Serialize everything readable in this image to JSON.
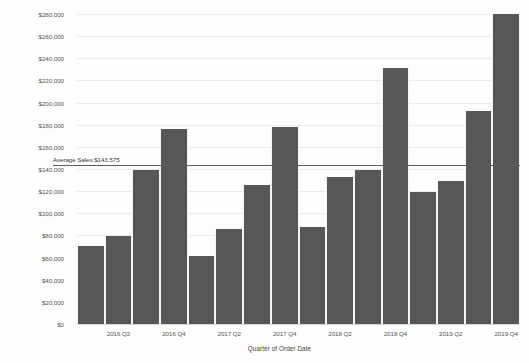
{
  "chart_data": {
    "type": "bar",
    "title": "",
    "xlabel": "Quarter of Order Date",
    "ylabel": "Sales",
    "ylim": [
      0,
      280000
    ],
    "ytick_step": 20000,
    "grid": true,
    "legend": "none",
    "bar_color": "#555759",
    "categories": [
      "2016 Q1",
      "2016 Q2",
      "2016 Q3",
      "2016 Q4",
      "2017 Q1",
      "2017 Q2",
      "2017 Q3",
      "2017 Q4",
      "2018 Q1",
      "2018 Q2",
      "2018 Q3",
      "2018 Q4",
      "2019 Q1",
      "2019 Q2",
      "2019 Q3",
      "2019 Q4"
    ],
    "values": [
      70500,
      79500,
      139000,
      176000,
      61500,
      86000,
      125500,
      178000,
      87500,
      133000,
      139000,
      231500,
      119000,
      129000,
      192500,
      280000
    ],
    "visible_xtick_labels": [
      "2016 Q2",
      "2016 Q4",
      "2017 Q2",
      "2017 Q4",
      "2018 Q2",
      "2018 Q4",
      "2019 Q2",
      "2019 Q4"
    ],
    "ytick_labels": [
      "$280,000",
      "$260,000",
      "$240,000",
      "$220,000",
      "$200,000",
      "$180,000",
      "$160,000",
      "$140,000",
      "$120,000",
      "$100,000",
      "$80,000",
      "$60,000",
      "$40,000",
      "$20,000",
      "$0"
    ],
    "ytick_values": [
      280000,
      260000,
      240000,
      220000,
      200000,
      180000,
      160000,
      140000,
      120000,
      100000,
      80000,
      60000,
      40000,
      20000,
      0
    ],
    "reference_line": {
      "label": "Average Sales:$143,575",
      "value": 143575,
      "color": "#5c5c5c"
    }
  }
}
